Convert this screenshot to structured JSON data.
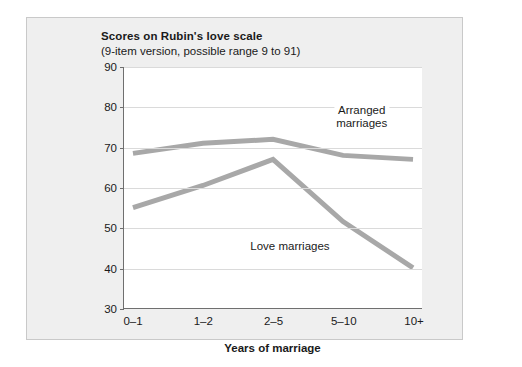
{
  "chart_data": {
    "type": "line",
    "title": "Scores on Rubin's love scale",
    "subtitle": "(9-item version, possible range 9 to 91)",
    "xlabel": "Years of marriage",
    "ylabel": "",
    "categories": [
      "0–1",
      "1–2",
      "2–5",
      "5–10",
      "10+"
    ],
    "series": [
      {
        "name": "Arranged marriages",
        "values": [
          68.5,
          71,
          72,
          68,
          67
        ],
        "color": "#a8a8a8"
      },
      {
        "name": "Love marriages",
        "values": [
          55,
          60.5,
          67,
          51.5,
          40
        ],
        "color": "#a8a8a8"
      }
    ],
    "ylim": [
      30,
      90
    ],
    "yticks": [
      30,
      40,
      50,
      60,
      70,
      80,
      90
    ],
    "ytick_labels": [
      "30",
      "40",
      "50",
      "60",
      "70",
      "80",
      "90"
    ],
    "grid": true,
    "legend_position": "inline-annotations",
    "annotations": [
      {
        "text": "Arranged marriages",
        "lines": [
          "Arranged",
          "marriages"
        ],
        "x_frac": 0.795,
        "y_value": 77.5
      },
      {
        "text": "Love marriages",
        "lines": [
          "Love marriages"
        ],
        "x_frac": 0.555,
        "y_value": 45.6
      }
    ],
    "colors": {
      "line": "#a8a8a8",
      "axis": "#6f6f6f",
      "grid": "#dadada",
      "figure_background": "#efefef",
      "plot_background": "#ffffff",
      "text": "#1a1a1a"
    }
  }
}
